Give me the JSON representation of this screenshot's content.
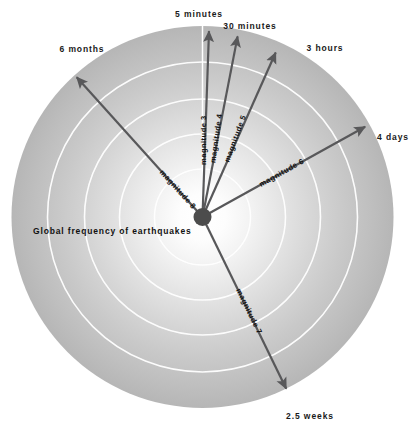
{
  "figure": {
    "caption": "Global frequency of earthquakes",
    "caption_pos": {
      "x": 33,
      "y": 227
    },
    "disk": {
      "center_x": 202.5,
      "center_y": 217,
      "radius": 191,
      "hub_radius": 9,
      "hub_color": "#4c4c4c",
      "ring_color": "#ffffff",
      "edge_color": "#b4b4b4",
      "core_color": "#ffffff",
      "ring_radii": [
        48,
        83,
        118,
        155,
        191
      ],
      "vertical_guide": true
    },
    "colors": {
      "arrow": "#58585a",
      "text": "#141414",
      "background": "#ffffff"
    }
  },
  "chart_data": {
    "type": "pie",
    "title": "Global frequency of earthquakes",
    "xlabel": "",
    "ylabel": "",
    "legend_position": "none",
    "grid": true,
    "note": "Radial diagram: each ray is an earthquake magnitude class; the outer label is the average recurrence interval between events of that magnitude worldwide. Ray length grows with recurrence interval.",
    "categories": [
      "magnitude 3",
      "magnitude 4",
      "magnitude 5",
      "magnitude 6",
      "magnitude 7",
      "magnitude 8"
    ],
    "values": [
      "5 minutes",
      "30 minutes",
      "3 hours",
      "4 days",
      "2.5 weeks",
      "6 months"
    ],
    "series": [
      {
        "name": "recurrence interval",
        "values": [
          "5 minutes",
          "30 minutes",
          "3 hours",
          "4 days",
          "2.5 weeks",
          "6 months"
        ]
      }
    ],
    "rays": [
      {
        "magnitude_label": "magnitude 3",
        "time_label": "5 minutes",
        "angle_deg": -88,
        "length": 186,
        "label_start": 52,
        "label_rotation_deg": -90,
        "time_label_pos": {
          "x": 199,
          "y": 10,
          "align": "center"
        }
      },
      {
        "magnitude_label": "magnitude 4",
        "time_label": "30 minutes",
        "angle_deg": -79,
        "length": 184,
        "label_start": 55,
        "label_rotation_deg": -82,
        "time_label_pos": {
          "x": 250,
          "y": 22,
          "align": "center"
        }
      },
      {
        "magnitude_label": "magnitude 5",
        "time_label": "3 hours",
        "angle_deg": -66,
        "length": 180,
        "label_start": 60,
        "label_rotation_deg": -70,
        "time_label_pos": {
          "x": 325,
          "y": 44,
          "align": "center"
        }
      },
      {
        "magnitude_label": "magnitude 6",
        "time_label": "4 days",
        "angle_deg": -29,
        "length": 186,
        "label_start": 66,
        "label_rotation_deg": -29,
        "time_label_pos": {
          "x": 393,
          "y": 133,
          "align": "center"
        }
      },
      {
        "magnitude_label": "magnitude 7",
        "time_label": "2.5 weeks",
        "angle_deg": 64,
        "length": 191,
        "label_start": 80,
        "label_rotation_deg": 64,
        "time_label_pos": {
          "x": 310,
          "y": 412,
          "align": "center"
        }
      },
      {
        "magnitude_label": "magnitude 8",
        "time_label": "6 months",
        "angle_deg": -132,
        "length": 188,
        "label_start": 62,
        "label_rotation_deg": 48,
        "time_label_pos": {
          "x": 82,
          "y": 45,
          "align": "center"
        }
      }
    ]
  }
}
